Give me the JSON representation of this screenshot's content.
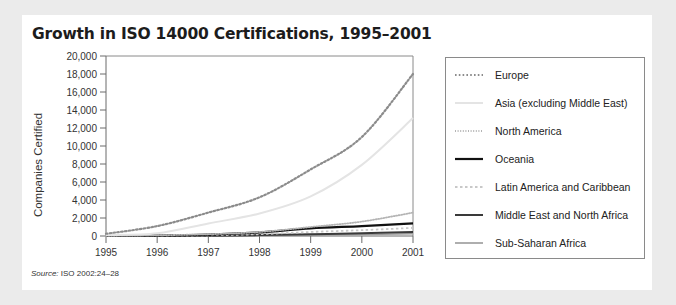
{
  "title": "Growth in ISO 14000 Certifications, 1995–2001",
  "source": {
    "label": "Source:",
    "text": " ISO 2002:24–28"
  },
  "colors": {
    "background": "#ebebeb",
    "card": "#ffffff",
    "europe": "#8c8c8c",
    "asia": "#e4e4e4",
    "north_america": "#b4b4b4",
    "oceania": "#111111",
    "latin_america": "#c8c8c8",
    "middle_east": "#3a3a3a",
    "sub_saharan": "#9a9a9a"
  },
  "chart_data": {
    "type": "line",
    "title": "Growth in ISO 14000 Certifications, 1995–2001",
    "xlabel": "",
    "ylabel": "Companies Certified",
    "x": [
      1995,
      1996,
      1997,
      1998,
      1999,
      2000,
      2001
    ],
    "x_tick_labels": [
      "1995",
      "1996",
      "1997",
      "1998",
      "1999",
      "2000",
      "2001"
    ],
    "y_tick_labels": [
      "0",
      "2,000",
      "4,000",
      "6,000",
      "8,000",
      "10,000",
      "12,000",
      "14,000",
      "16,000",
      "18,000",
      "20,000"
    ],
    "ylim": [
      0,
      20000
    ],
    "grid": false,
    "legend_position": "right",
    "series": [
      {
        "name": "Europe",
        "style": "dotted",
        "values": [
          250,
          1100,
          2600,
          4300,
          7400,
          11000,
          18000
        ]
      },
      {
        "name": "Asia (excluding Middle East)",
        "style": "solid-light",
        "values": [
          100,
          300,
          1400,
          2500,
          4400,
          7900,
          13100
        ]
      },
      {
        "name": "North America",
        "style": "dotted-fine",
        "values": [
          20,
          80,
          200,
          450,
          1000,
          1600,
          2600
        ]
      },
      {
        "name": "Oceania",
        "style": "solid-black",
        "values": [
          10,
          50,
          150,
          400,
          850,
          1100,
          1400
        ]
      },
      {
        "name": "Latin America and Caribbean",
        "style": "dashed-light",
        "values": [
          5,
          20,
          80,
          200,
          450,
          650,
          900
        ]
      },
      {
        "name": "Middle East and North Africa",
        "style": "solid-dark",
        "values": [
          5,
          15,
          40,
          100,
          200,
          300,
          450
        ]
      },
      {
        "name": "Sub-Saharan Africa",
        "style": "solid-gray",
        "values": [
          5,
          10,
          30,
          60,
          120,
          170,
          250
        ]
      }
    ]
  },
  "legend": {
    "items": [
      {
        "label": "Europe"
      },
      {
        "label": "Asia (excluding Middle East)"
      },
      {
        "label": "North America"
      },
      {
        "label": "Oceania"
      },
      {
        "label": "Latin America and Caribbean"
      },
      {
        "label": "Middle East and North Africa"
      },
      {
        "label": "Sub-Saharan Africa"
      }
    ]
  }
}
